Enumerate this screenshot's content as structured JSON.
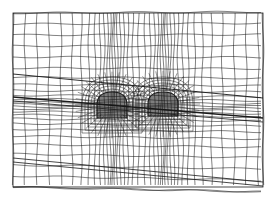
{
  "diagram": {
    "type": "finite-element-mesh",
    "bounds": {
      "x0": 13,
      "y0": 13,
      "x1": 263,
      "y1": 187
    },
    "line_color": "#1a1a1a",
    "background": "#ffffff",
    "tunnels": [
      {
        "cx": 112,
        "cy": 105,
        "w": 30,
        "h": 26
      },
      {
        "cx": 163,
        "cy": 104,
        "w": 30,
        "h": 24
      }
    ],
    "strata_lines": [
      {
        "y0": 74,
        "y1": 98,
        "width": 0.9
      },
      {
        "y0": 97,
        "y1": 118,
        "width": 1.6
      },
      {
        "y0": 101,
        "y1": 122,
        "width": 0.8
      },
      {
        "y0": 158,
        "y1": 182,
        "width": 0.8
      },
      {
        "y0": 162,
        "y1": 186,
        "width": 0.8
      }
    ]
  }
}
